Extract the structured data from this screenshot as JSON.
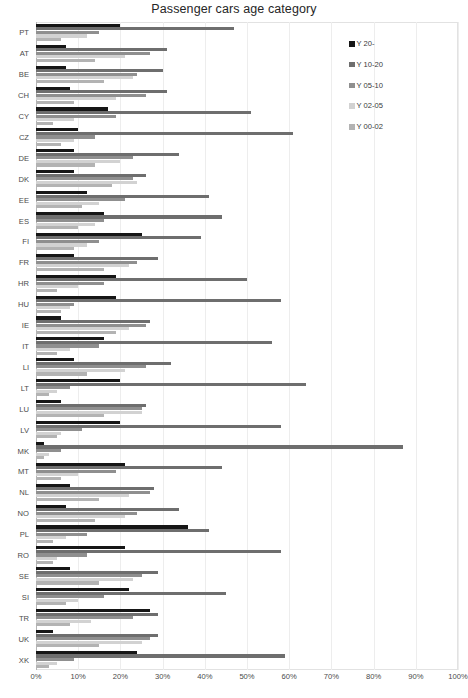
{
  "chart_data": {
    "type": "bar",
    "orientation": "horizontal",
    "title": "Passenger cars age category",
    "xlabel": "",
    "ylabel": "",
    "xlim": [
      0,
      100
    ],
    "xtick_labels": [
      "0%",
      "10%",
      "20%",
      "30%",
      "40%",
      "50%",
      "60%",
      "70%",
      "80%",
      "90%",
      "100%"
    ],
    "xtick_values": [
      0,
      10,
      20,
      30,
      40,
      50,
      60,
      70,
      80,
      90,
      100
    ],
    "grid": true,
    "legend_position": "upper right",
    "categories": [
      "PT",
      "AT",
      "BE",
      "CH",
      "CY",
      "CZ",
      "DE",
      "DK",
      "EE",
      "ES",
      "FI",
      "FR",
      "HR",
      "HU",
      "IE",
      "IT",
      "LI",
      "LT",
      "LU",
      "LV",
      "MK",
      "MT",
      "NL",
      "NO",
      "PL",
      "RO",
      "SE",
      "SI",
      "TR",
      "UK",
      "XK"
    ],
    "series": [
      {
        "name": "Y 20-",
        "color": "#161616",
        "values": [
          20.0,
          7.0,
          7.0,
          8.0,
          17.0,
          10.0,
          9.0,
          9.0,
          12.0,
          16.0,
          25.0,
          9.0,
          19.0,
          19.0,
          6.0,
          16.0,
          9.0,
          20.0,
          6.0,
          20.0,
          2.0,
          21.0,
          8.0,
          7.0,
          36.0,
          21.0,
          8.0,
          22.0,
          27.0,
          4.0,
          24.0
        ]
      },
      {
        "name": "Y 10-20",
        "color": "#6e6e6e",
        "values": [
          47.0,
          31.0,
          30.0,
          31.0,
          51.0,
          61.0,
          34.0,
          26.0,
          41.0,
          44.0,
          39.0,
          29.0,
          50.0,
          58.0,
          27.0,
          56.0,
          32.0,
          64.0,
          26.0,
          58.0,
          87.0,
          44.0,
          28.0,
          34.0,
          41.0,
          58.0,
          29.0,
          45.0,
          29.0,
          29.0,
          59.0
        ]
      },
      {
        "name": "Y 05-10",
        "color": "#8f8f8f",
        "values": [
          15.0,
          27.0,
          24.0,
          26.0,
          19.0,
          14.0,
          23.0,
          23.0,
          21.0,
          16.0,
          15.0,
          24.0,
          16.0,
          9.0,
          26.0,
          15.0,
          26.0,
          8.0,
          25.0,
          11.0,
          6.0,
          19.0,
          27.0,
          24.0,
          12.0,
          12.0,
          25.0,
          16.0,
          23.0,
          27.0,
          9.0
        ]
      },
      {
        "name": "Y 02-05",
        "color": "#d2d2d2",
        "values": [
          12.0,
          21.0,
          23.0,
          19.0,
          9.0,
          9.0,
          20.0,
          24.0,
          15.0,
          14.0,
          12.0,
          22.0,
          10.0,
          8.0,
          22.0,
          8.0,
          21.0,
          5.0,
          25.0,
          6.0,
          3.0,
          10.0,
          22.0,
          21.0,
          7.0,
          5.0,
          23.0,
          10.0,
          13.0,
          25.0,
          5.0
        ]
      },
      {
        "name": "Y 00-02",
        "color": "#b3b3b3",
        "values": [
          6.0,
          14.0,
          16.0,
          9.0,
          4.0,
          6.0,
          14.0,
          18.0,
          11.0,
          10.0,
          9.0,
          16.0,
          5.0,
          6.0,
          19.0,
          5.0,
          12.0,
          3.0,
          16.0,
          5.0,
          2.0,
          6.0,
          15.0,
          14.0,
          4.0,
          4.0,
          15.0,
          7.0,
          8.0,
          15.0,
          3.0
        ]
      }
    ]
  }
}
